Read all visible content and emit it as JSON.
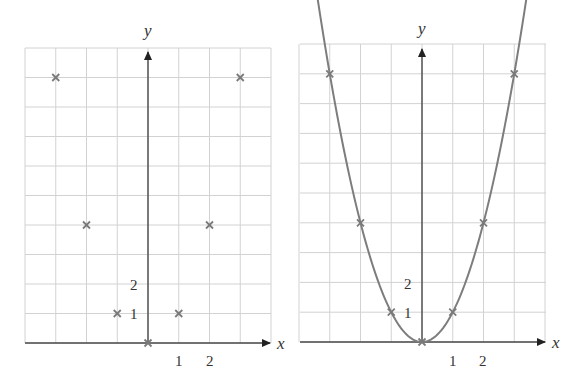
{
  "chart_data": [
    {
      "type": "scatter",
      "title": "",
      "xlabel": "x",
      "ylabel": "y",
      "x_tick_labels": [
        "1",
        "2"
      ],
      "y_tick_labels": [
        "1",
        "2"
      ],
      "grid": true,
      "xlim": [
        -4,
        4
      ],
      "ylim": [
        0,
        10
      ],
      "points": [
        {
          "x": -3,
          "y": 9
        },
        {
          "x": -2,
          "y": 4
        },
        {
          "x": -1,
          "y": 1
        },
        {
          "x": 0,
          "y": 0
        },
        {
          "x": 1,
          "y": 1
        },
        {
          "x": 2,
          "y": 4
        },
        {
          "x": 3,
          "y": 9
        }
      ]
    },
    {
      "type": "line",
      "title": "",
      "xlabel": "x",
      "ylabel": "y",
      "x_tick_labels": [
        "1",
        "2"
      ],
      "y_tick_labels": [
        "1",
        "2"
      ],
      "grid": true,
      "xlim": [
        -4,
        4
      ],
      "ylim": [
        0,
        10
      ],
      "curve": "y = x^2",
      "points": [
        {
          "x": -3,
          "y": 9
        },
        {
          "x": -2,
          "y": 4
        },
        {
          "x": -1,
          "y": 1
        },
        {
          "x": 0,
          "y": 0
        },
        {
          "x": 1,
          "y": 1
        },
        {
          "x": 2,
          "y": 4
        },
        {
          "x": 3,
          "y": 9
        }
      ]
    }
  ],
  "left": {
    "x_axis_label": "x",
    "y_axis_label": "y",
    "x_ticks": [
      "1",
      "2"
    ],
    "y_ticks": [
      "1",
      "2"
    ]
  },
  "right": {
    "x_axis_label": "x",
    "y_axis_label": "y",
    "x_ticks": [
      "1",
      "2"
    ],
    "y_ticks": [
      "1",
      "2"
    ]
  },
  "colors": {
    "grid": "#d2d2d2",
    "axis": "#4a4a4a",
    "marks": "#7a7a7a",
    "curve": "#7d7d7d"
  }
}
